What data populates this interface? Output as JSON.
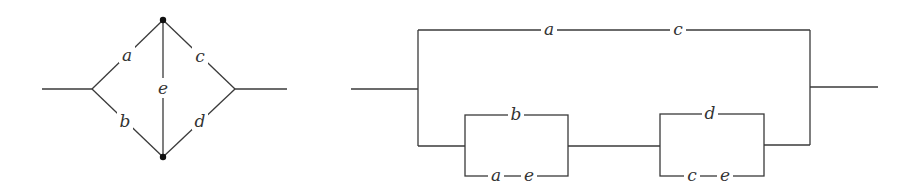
{
  "left_diagram": {
    "description": "Bridge network with components a, b, c, d and bridging element e",
    "labels": {
      "a": "a",
      "b": "b",
      "c": "c",
      "d": "d",
      "e": "e"
    },
    "nodes": [
      "top",
      "bottom"
    ]
  },
  "right_diagram": {
    "description": "Equivalent series-parallel decomposition",
    "top_path": {
      "first": "a",
      "second": "c"
    },
    "lower_block_1": {
      "top": "b",
      "bottom_first": "a",
      "bottom_second": "e"
    },
    "lower_block_2": {
      "top": "d",
      "bottom_first": "c",
      "bottom_second": "e"
    }
  },
  "colors": {
    "line": "#3a3a3a",
    "text": "#333333",
    "background": "#ffffff"
  }
}
